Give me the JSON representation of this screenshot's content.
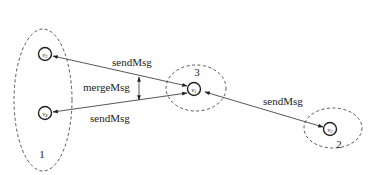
{
  "diagram": {
    "type": "message-passing cluster diagram",
    "clusters": [
      {
        "id": "1",
        "label": "1",
        "members": [
          "v2",
          "v4"
        ]
      },
      {
        "id": "2",
        "label": "2",
        "members": [
          "v3"
        ]
      },
      {
        "id": "3",
        "label": "3",
        "members": [
          "v1"
        ]
      }
    ],
    "nodes": [
      {
        "id": "v1",
        "label": "v1",
        "base": "v",
        "sub": "1"
      },
      {
        "id": "v2",
        "label": "v2",
        "base": "v",
        "sub": "2"
      },
      {
        "id": "v3",
        "label": "v3",
        "base": "v",
        "sub": "3"
      },
      {
        "id": "v4",
        "label": "v4",
        "base": "v",
        "sub": "4"
      }
    ],
    "edges": [
      {
        "from": "v1",
        "to": "v2",
        "label": "sendMsg"
      },
      {
        "from": "v1",
        "to": "v4",
        "label": "sendMsg"
      },
      {
        "from": "v1",
        "to": "v3",
        "label": "sendMsg"
      }
    ],
    "annotations": [
      {
        "label": "mergeMsg",
        "between": [
          "v1-v2 edge",
          "v1-v4 edge"
        ]
      }
    ]
  }
}
